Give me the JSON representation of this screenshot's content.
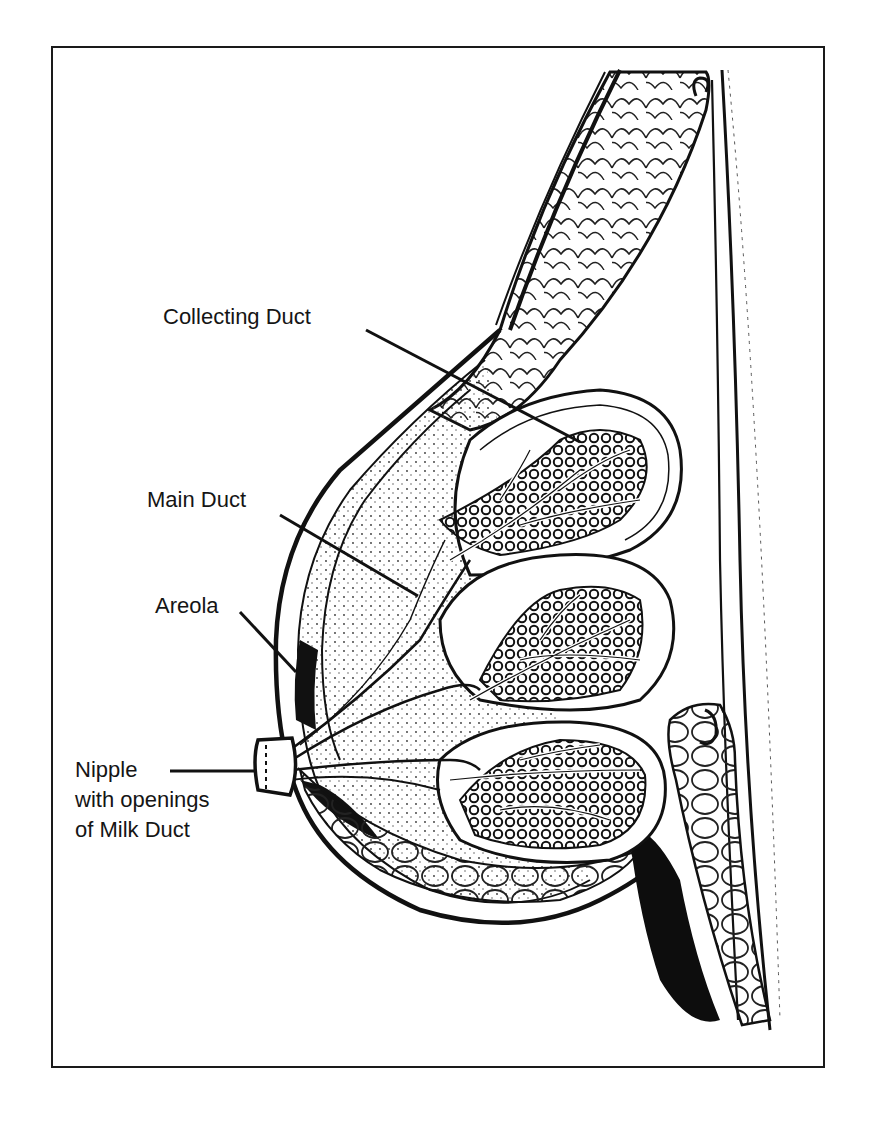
{
  "figure": {
    "type": "anatomical-illustration",
    "style": "black and white line drawing",
    "top_cutoff_text": "",
    "labels": [
      {
        "id": "collecting-duct",
        "text": "Collecting Duct"
      },
      {
        "id": "main-duct",
        "text": "Main Duct"
      },
      {
        "id": "areola",
        "text": "Areola"
      },
      {
        "id": "nipple",
        "lines": [
          "Nipple",
          "with openings",
          "of Milk Duct"
        ]
      }
    ],
    "colors": {
      "ink": "#111111",
      "background": "#ffffff",
      "frame": "#1a1a1a"
    }
  }
}
